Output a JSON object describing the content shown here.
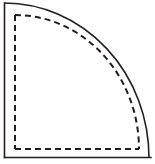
{
  "figure": {
    "name": "quarter-round-fillet-diagram",
    "canvas": {
      "width": 155,
      "height": 164
    },
    "background_color": "#ffffff",
    "stroke_color": "#231f20",
    "solid_stroke_width": 1.6,
    "dashed_stroke_width": 2.0,
    "dash_pattern": "6 4",
    "solid_outline": {
      "name": "outer-quarter-round-profile",
      "left_edge": {
        "x": 4.5,
        "y_top": 3.0,
        "y_bottom": 157.5
      },
      "bottom_edge": {
        "y": 157.5,
        "x_left": 4.5,
        "x_right": 151.0
      },
      "arc": {
        "start": {
          "x": 4.5,
          "y": 3.0
        },
        "end": {
          "x": 149.0,
          "y": 157.5
        },
        "radius_x": 145.0,
        "radius_y": 155.0,
        "sweep": "convex-outward"
      }
    },
    "dashed_outline": {
      "name": "inner-quarter-round-profile",
      "left_edge": {
        "x": 15.0,
        "y_top": 15.0,
        "y_bottom": 149.0
      },
      "bottom_edge": {
        "y": 149.0,
        "x_left": 15.0,
        "x_right": 139.0
      },
      "arc": {
        "start": {
          "x": 15.0,
          "y": 15.0
        },
        "end": {
          "x": 139.0,
          "y": 149.0
        },
        "radius_x": 124.0,
        "radius_y": 134.0,
        "sweep": "convex-outward"
      }
    }
  },
  "chart_data": {
    "type": "diagram",
    "title": "",
    "elements": [
      {
        "id": "solid-left-edge",
        "kind": "line",
        "style": "solid",
        "from": [
          4.5,
          3.0
        ],
        "to": [
          4.5,
          157.5
        ]
      },
      {
        "id": "solid-bottom-edge",
        "kind": "line",
        "style": "solid",
        "from": [
          4.5,
          157.5
        ],
        "to": [
          151.0,
          157.5
        ]
      },
      {
        "id": "solid-arc",
        "kind": "arc",
        "style": "solid",
        "from": [
          4.5,
          3.0
        ],
        "to": [
          149.0,
          157.5
        ],
        "rx": 145.0,
        "ry": 155.0
      },
      {
        "id": "dashed-left-edge",
        "kind": "line",
        "style": "dashed",
        "from": [
          15.0,
          15.0
        ],
        "to": [
          15.0,
          149.0
        ]
      },
      {
        "id": "dashed-bottom-edge",
        "kind": "line",
        "style": "dashed",
        "from": [
          15.0,
          149.0
        ],
        "to": [
          139.0,
          149.0
        ]
      },
      {
        "id": "dashed-arc",
        "kind": "arc",
        "style": "dashed",
        "from": [
          15.0,
          15.0
        ],
        "to": [
          139.0,
          149.0
        ],
        "rx": 124.0,
        "ry": 134.0
      }
    ],
    "xlabel": "",
    "ylabel": "",
    "legend": [],
    "annotations": [],
    "grid": false
  }
}
